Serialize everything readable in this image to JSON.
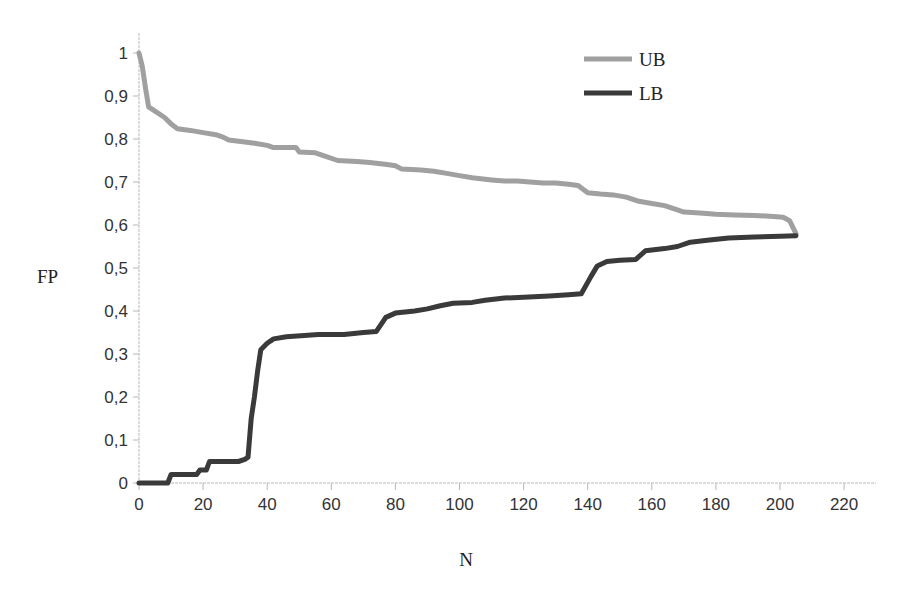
{
  "chart_data": {
    "type": "line",
    "title": "",
    "xlabel": "N",
    "ylabel": "FP",
    "xlim": [
      0,
      230
    ],
    "ylim": [
      0,
      1
    ],
    "grid": false,
    "legend_position": "top-right (inside plot)",
    "x_ticks": [
      0,
      20,
      40,
      60,
      80,
      100,
      120,
      140,
      160,
      180,
      200,
      220
    ],
    "y_ticks": [
      0,
      0.1,
      0.2,
      0.3,
      0.4,
      0.5,
      0.6,
      0.7,
      0.8,
      0.9,
      1
    ],
    "y_tick_labels": [
      "0",
      "0,1",
      "0,2",
      "0,3",
      "0,4",
      "0,5",
      "0,6",
      "0,7",
      "0,8",
      "0,9",
      "1"
    ],
    "x_tick_labels": [
      "0",
      "20",
      "40",
      "60",
      "80",
      "100",
      "120",
      "140",
      "160",
      "180",
      "200",
      "220"
    ],
    "series": [
      {
        "name": "UB",
        "color": "#a0a0a0",
        "points": [
          [
            0,
            1.0
          ],
          [
            1,
            0.97
          ],
          [
            2,
            0.92
          ],
          [
            3,
            0.875
          ],
          [
            5,
            0.865
          ],
          [
            8,
            0.85
          ],
          [
            10,
            0.835
          ],
          [
            12,
            0.824
          ],
          [
            16,
            0.82
          ],
          [
            20,
            0.815
          ],
          [
            24,
            0.81
          ],
          [
            26,
            0.805
          ],
          [
            28,
            0.798
          ],
          [
            33,
            0.793
          ],
          [
            36,
            0.79
          ],
          [
            40,
            0.785
          ],
          [
            42,
            0.78
          ],
          [
            46,
            0.78
          ],
          [
            49,
            0.78
          ],
          [
            50,
            0.77
          ],
          [
            55,
            0.768
          ],
          [
            58,
            0.76
          ],
          [
            62,
            0.75
          ],
          [
            68,
            0.748
          ],
          [
            72,
            0.745
          ],
          [
            78,
            0.74
          ],
          [
            80,
            0.738
          ],
          [
            82,
            0.73
          ],
          [
            88,
            0.728
          ],
          [
            92,
            0.725
          ],
          [
            96,
            0.72
          ],
          [
            100,
            0.715
          ],
          [
            104,
            0.71
          ],
          [
            110,
            0.705
          ],
          [
            114,
            0.702
          ],
          [
            118,
            0.702
          ],
          [
            122,
            0.7
          ],
          [
            126,
            0.698
          ],
          [
            130,
            0.698
          ],
          [
            134,
            0.695
          ],
          [
            137,
            0.692
          ],
          [
            140,
            0.675
          ],
          [
            144,
            0.672
          ],
          [
            148,
            0.67
          ],
          [
            152,
            0.665
          ],
          [
            156,
            0.655
          ],
          [
            160,
            0.65
          ],
          [
            164,
            0.645
          ],
          [
            168,
            0.635
          ],
          [
            170,
            0.63
          ],
          [
            175,
            0.628
          ],
          [
            180,
            0.625
          ],
          [
            186,
            0.623
          ],
          [
            192,
            0.622
          ],
          [
            198,
            0.62
          ],
          [
            201,
            0.618
          ],
          [
            203,
            0.61
          ],
          [
            204,
            0.595
          ],
          [
            205,
            0.58
          ]
        ]
      },
      {
        "name": "LB",
        "color": "#3a3a3a",
        "points": [
          [
            0,
            0.0
          ],
          [
            9,
            0.0
          ],
          [
            10,
            0.02
          ],
          [
            18,
            0.02
          ],
          [
            19,
            0.03
          ],
          [
            21,
            0.03
          ],
          [
            22,
            0.05
          ],
          [
            31,
            0.05
          ],
          [
            33,
            0.055
          ],
          [
            34,
            0.06
          ],
          [
            35,
            0.15
          ],
          [
            36,
            0.2
          ],
          [
            37,
            0.26
          ],
          [
            38,
            0.31
          ],
          [
            40,
            0.325
          ],
          [
            42,
            0.335
          ],
          [
            46,
            0.34
          ],
          [
            56,
            0.345
          ],
          [
            64,
            0.345
          ],
          [
            70,
            0.35
          ],
          [
            74,
            0.352
          ],
          [
            77,
            0.385
          ],
          [
            80,
            0.395
          ],
          [
            86,
            0.4
          ],
          [
            90,
            0.405
          ],
          [
            94,
            0.412
          ],
          [
            98,
            0.418
          ],
          [
            104,
            0.42
          ],
          [
            108,
            0.425
          ],
          [
            114,
            0.43
          ],
          [
            120,
            0.432
          ],
          [
            128,
            0.435
          ],
          [
            134,
            0.438
          ],
          [
            138,
            0.44
          ],
          [
            141,
            0.48
          ],
          [
            143,
            0.505
          ],
          [
            146,
            0.515
          ],
          [
            150,
            0.518
          ],
          [
            155,
            0.52
          ],
          [
            158,
            0.54
          ],
          [
            164,
            0.545
          ],
          [
            168,
            0.55
          ],
          [
            172,
            0.56
          ],
          [
            178,
            0.565
          ],
          [
            184,
            0.57
          ],
          [
            192,
            0.572
          ],
          [
            200,
            0.574
          ],
          [
            205,
            0.575
          ]
        ]
      }
    ]
  },
  "legend": {
    "items": [
      {
        "label": "UB",
        "color": "#a0a0a0"
      },
      {
        "label": "LB",
        "color": "#3a3a3a"
      }
    ]
  },
  "axes": {
    "x_title": "N",
    "y_title": "FP",
    "axis_color": "#b0b0b0"
  }
}
